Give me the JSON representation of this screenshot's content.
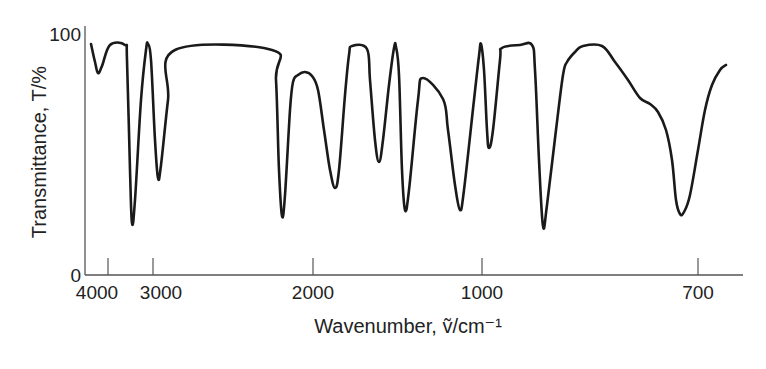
{
  "chart_data": {
    "type": "line",
    "title": "",
    "xlabel": "Wavenumber, ṽ/cm⁻¹",
    "ylabel": "Transmittance, T/%",
    "x_axis_reversed": true,
    "x_axis_scale": "nonlinear (compressed above 2000 cm⁻¹)",
    "grid": false,
    "legend": null,
    "ylim": [
      0,
      100
    ],
    "y_ticks": [
      {
        "label": "0",
        "value": 0
      },
      {
        "label": "100",
        "value": 100
      }
    ],
    "x_ticks": [
      {
        "label": "4000",
        "value": 4000,
        "px": 108
      },
      {
        "label": "3000",
        "value": 3000,
        "px": 153
      },
      {
        "label": "2000",
        "value": 2000,
        "px": 313
      },
      {
        "label": "1000",
        "value": 1000,
        "px": 482
      },
      {
        "label": "700",
        "value": 700,
        "px": 698
      }
    ],
    "series": [
      {
        "name": "IR spectrum",
        "color": "#1a1a1a",
        "points_px": [
          [
            91,
            44
          ],
          [
            95,
            62
          ],
          [
            98,
            73
          ],
          [
            102,
            66
          ],
          [
            110,
            45
          ],
          [
            125,
            45
          ],
          [
            127,
            60
          ],
          [
            130,
            170
          ],
          [
            132,
            223
          ],
          [
            135,
            200
          ],
          [
            141,
            100
          ],
          [
            146,
            50
          ],
          [
            148,
            44
          ],
          [
            151,
            60
          ],
          [
            155,
            140
          ],
          [
            158,
            178
          ],
          [
            161,
            165
          ],
          [
            168,
            100
          ],
          [
            175,
            50
          ],
          [
            272,
            50
          ],
          [
            276,
            80
          ],
          [
            279,
            170
          ],
          [
            282,
            216
          ],
          [
            285,
            195
          ],
          [
            290,
            110
          ],
          [
            293,
            82
          ],
          [
            298,
            75
          ],
          [
            305,
            72
          ],
          [
            312,
            76
          ],
          [
            318,
            90
          ],
          [
            324,
            130
          ],
          [
            330,
            170
          ],
          [
            335,
            188
          ],
          [
            339,
            170
          ],
          [
            345,
            95
          ],
          [
            349,
            55
          ],
          [
            352,
            46
          ],
          [
            367,
            49
          ],
          [
            370,
            80
          ],
          [
            375,
            140
          ],
          [
            379,
            162
          ],
          [
            383,
            140
          ],
          [
            389,
            85
          ],
          [
            394,
            48
          ],
          [
            396,
            47
          ],
          [
            399,
            75
          ],
          [
            402,
            170
          ],
          [
            405,
            210
          ],
          [
            409,
            190
          ],
          [
            418,
            100
          ],
          [
            423,
            78
          ],
          [
            443,
            99
          ],
          [
            448,
            130
          ],
          [
            455,
            185
          ],
          [
            460,
            210
          ],
          [
            464,
            190
          ],
          [
            474,
            100
          ],
          [
            479,
            56
          ],
          [
            481,
            44
          ],
          [
            484,
            70
          ],
          [
            487,
            130
          ],
          [
            489,
            148
          ],
          [
            493,
            130
          ],
          [
            500,
            60
          ],
          [
            502,
            48
          ],
          [
            520,
            45
          ],
          [
            532,
            45
          ],
          [
            535,
            70
          ],
          [
            539,
            160
          ],
          [
            543,
            226
          ],
          [
            547,
            205
          ],
          [
            556,
            130
          ],
          [
            563,
            75
          ],
          [
            567,
            62
          ],
          [
            575,
            52
          ],
          [
            583,
            46
          ],
          [
            602,
            46
          ],
          [
            615,
            62
          ],
          [
            628,
            80
          ],
          [
            640,
            98
          ],
          [
            650,
            104
          ],
          [
            658,
            112
          ],
          [
            666,
            130
          ],
          [
            672,
            160
          ],
          [
            676,
            200
          ],
          [
            680,
            214
          ],
          [
            684,
            212
          ],
          [
            690,
            195
          ],
          [
            698,
            150
          ],
          [
            705,
            110
          ],
          [
            712,
            85
          ],
          [
            720,
            70
          ],
          [
            726,
            65
          ]
        ],
        "approx_values": [
          {
            "feature": "peak",
            "x_label": "~3700",
            "T": 84
          },
          {
            "feature": "min",
            "x_label": "~3300",
            "T": 22
          },
          {
            "feature": "min",
            "x_label": "~2950",
            "T": 40
          },
          {
            "feature": "min",
            "x_label": "~2100",
            "T": 25
          },
          {
            "feature": "min",
            "x_label": "~1870",
            "T": 36
          },
          {
            "feature": "min",
            "x_label": "~1600",
            "T": 47
          },
          {
            "feature": "min",
            "x_label": "~1500",
            "T": 27
          },
          {
            "feature": "min",
            "x_label": "~1200",
            "T": 27
          },
          {
            "feature": "min",
            "x_label": "~960",
            "T": 53
          },
          {
            "feature": "min",
            "x_label": "~850",
            "T": 20
          },
          {
            "feature": "min",
            "x_label": "~720",
            "T": 25
          }
        ]
      }
    ]
  },
  "frame": {
    "left": 85,
    "right": 743,
    "top": 34,
    "bottom": 275
  }
}
